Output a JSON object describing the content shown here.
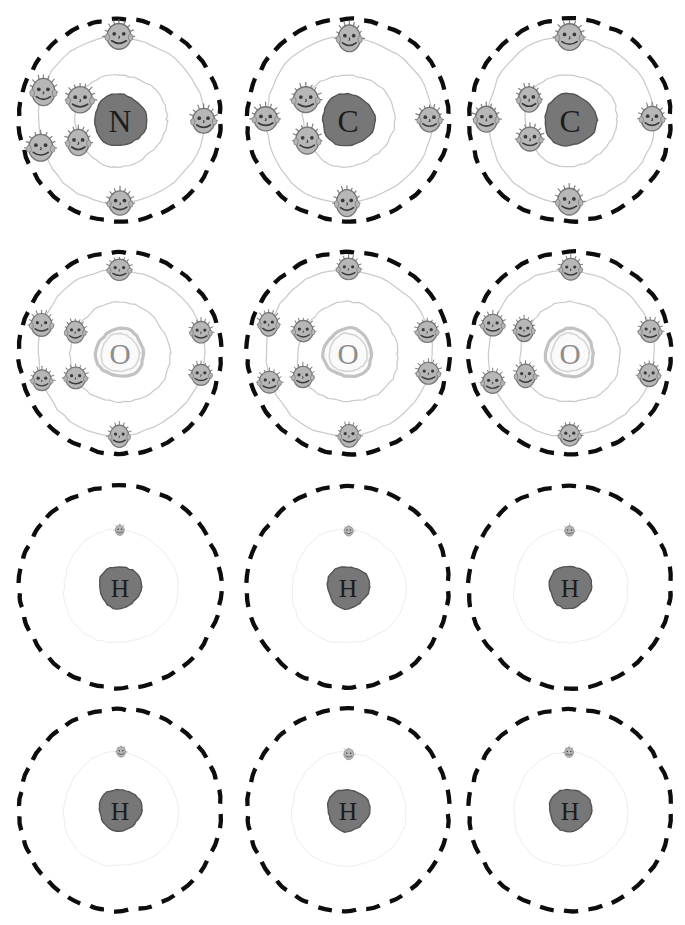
{
  "page": {
    "width": 685,
    "height": 925,
    "background": "#ffffff"
  },
  "style": {
    "shell_dash_color": "#0d0d0d",
    "orbit_line_color": "#bdbdbd",
    "orbit_line_faint": "#d8d8d8",
    "electron_fill": "#b4b4b4",
    "electron_stroke": "#6e6e6e",
    "electron_face_color": "#3a3a3a",
    "nucleus_dark_fill": "#6f6f6f",
    "nucleus_dark_stroke": "#4a4a4a",
    "nucleus_light_fill": "#fafafa",
    "nucleus_light_stroke": "#c2c2c2",
    "label_color": "#1c1c1c",
    "label_color_light": "#8d8d8d"
  },
  "legend": {
    "nucleus_note": "Nucleus labelled with element symbol",
    "electron_note": "Each electron is drawn as a smiling cartoon face",
    "outer_boundary_note": "Outer boundary drawn as a thick black dashed circle"
  },
  "grid": {
    "rows": 4,
    "columns": 3,
    "cell_width": 230,
    "cell_height": 230
  },
  "atoms": [
    {
      "id": "atom-r1c1",
      "symbol": "N",
      "name": "nitrogen",
      "row": 1,
      "column": 1,
      "x": 5,
      "y": 5,
      "nucleus_tone": "dark",
      "nucleus_radius": 26,
      "electron_size": "large",
      "shells": [
        {
          "index": 1,
          "radius": 46,
          "electron_count": 2,
          "angles": [
            242,
            298
          ]
        },
        {
          "index": 2,
          "radius": 83,
          "electron_count": 5,
          "angles": [
            250,
            290,
            180,
            0,
            90
          ]
        }
      ],
      "total_electrons": 7,
      "outer_dashed_radius": 101
    },
    {
      "id": "atom-r1c2",
      "symbol": "C",
      "name": "carbon",
      "row": 1,
      "column": 2,
      "x": 233,
      "y": 5,
      "nucleus_tone": "dark",
      "nucleus_radius": 26,
      "electron_size": "large",
      "shells": [
        {
          "index": 1,
          "radius": 46,
          "electron_count": 2,
          "angles": [
            244,
            296
          ]
        },
        {
          "index": 2,
          "radius": 83,
          "electron_count": 4,
          "angles": [
            270,
            180,
            0,
            90
          ]
        }
      ],
      "total_electrons": 6,
      "outer_dashed_radius": 101
    },
    {
      "id": "atom-r1c3",
      "symbol": "C",
      "name": "carbon",
      "row": 1,
      "column": 3,
      "x": 455,
      "y": 5,
      "nucleus_tone": "dark",
      "nucleus_radius": 26,
      "electron_size": "large",
      "shells": [
        {
          "index": 1,
          "radius": 46,
          "electron_count": 2,
          "angles": [
            244,
            296
          ]
        },
        {
          "index": 2,
          "radius": 83,
          "electron_count": 4,
          "angles": [
            270,
            180,
            0,
            90
          ]
        }
      ],
      "total_electrons": 6,
      "outer_dashed_radius": 101
    },
    {
      "id": "atom-r2c1",
      "symbol": "O",
      "name": "oxygen",
      "row": 2,
      "column": 1,
      "x": 5,
      "y": 238,
      "nucleus_tone": "light",
      "nucleus_radius": 24,
      "electron_size": "medium",
      "shells": [
        {
          "index": 1,
          "radius": 50,
          "electron_count": 2,
          "angles": [
            242,
            296
          ]
        },
        {
          "index": 2,
          "radius": 83,
          "electron_count": 6,
          "angles": [
            250,
            290,
            180,
            0,
            105,
            75
          ]
        }
      ],
      "total_electrons": 8,
      "outer_dashed_radius": 101
    },
    {
      "id": "atom-r2c2",
      "symbol": "O",
      "name": "oxygen",
      "row": 2,
      "column": 2,
      "x": 233,
      "y": 238,
      "nucleus_tone": "light",
      "nucleus_radius": 24,
      "electron_size": "medium",
      "shells": [
        {
          "index": 1,
          "radius": 50,
          "electron_count": 2,
          "angles": [
            242,
            296
          ]
        },
        {
          "index": 2,
          "radius": 83,
          "electron_count": 6,
          "angles": [
            250,
            290,
            180,
            0,
            105,
            75
          ]
        }
      ],
      "total_electrons": 8,
      "outer_dashed_radius": 101
    },
    {
      "id": "atom-r2c3",
      "symbol": "O",
      "name": "oxygen",
      "row": 2,
      "column": 3,
      "x": 455,
      "y": 238,
      "nucleus_tone": "light",
      "nucleus_radius": 24,
      "electron_size": "medium",
      "shells": [
        {
          "index": 1,
          "radius": 50,
          "electron_count": 2,
          "angles": [
            242,
            296
          ]
        },
        {
          "index": 2,
          "radius": 83,
          "electron_count": 6,
          "angles": [
            250,
            290,
            180,
            0,
            105,
            75
          ]
        }
      ],
      "total_electrons": 8,
      "outer_dashed_radius": 101
    },
    {
      "id": "atom-r3c1",
      "symbol": "H",
      "name": "hydrogen",
      "row": 3,
      "column": 1,
      "x": 5,
      "y": 472,
      "nucleus_tone": "dark",
      "nucleus_radius": 21,
      "electron_size": "small",
      "shells": [
        {
          "index": 1,
          "radius": 57,
          "electron_count": 1,
          "angles": [
            0
          ]
        }
      ],
      "total_electrons": 1,
      "outer_dashed_radius": 101
    },
    {
      "id": "atom-r3c2",
      "symbol": "H",
      "name": "hydrogen",
      "row": 3,
      "column": 2,
      "x": 233,
      "y": 472,
      "nucleus_tone": "dark",
      "nucleus_radius": 21,
      "electron_size": "small",
      "shells": [
        {
          "index": 1,
          "radius": 57,
          "electron_count": 1,
          "angles": [
            0
          ]
        }
      ],
      "total_electrons": 1,
      "outer_dashed_radius": 101
    },
    {
      "id": "atom-r3c3",
      "symbol": "H",
      "name": "hydrogen",
      "row": 3,
      "column": 3,
      "x": 455,
      "y": 472,
      "nucleus_tone": "dark",
      "nucleus_radius": 21,
      "electron_size": "small",
      "shells": [
        {
          "index": 1,
          "radius": 57,
          "electron_count": 1,
          "angles": [
            0
          ]
        }
      ],
      "total_electrons": 1,
      "outer_dashed_radius": 101
    },
    {
      "id": "atom-r4c1",
      "symbol": "H",
      "name": "hydrogen",
      "row": 4,
      "column": 1,
      "x": 5,
      "y": 695,
      "nucleus_tone": "dark",
      "nucleus_radius": 21,
      "electron_size": "small",
      "shells": [
        {
          "index": 1,
          "radius": 57,
          "electron_count": 1,
          "angles": [
            0
          ]
        }
      ],
      "total_electrons": 1,
      "outer_dashed_radius": 101
    },
    {
      "id": "atom-r4c2",
      "symbol": "H",
      "name": "hydrogen",
      "row": 4,
      "column": 2,
      "x": 233,
      "y": 695,
      "nucleus_tone": "dark",
      "nucleus_radius": 21,
      "electron_size": "small",
      "shells": [
        {
          "index": 1,
          "radius": 57,
          "electron_count": 1,
          "angles": [
            0
          ]
        }
      ],
      "total_electrons": 1,
      "outer_dashed_radius": 101
    },
    {
      "id": "atom-r4c3",
      "symbol": "H",
      "name": "hydrogen",
      "row": 4,
      "column": 3,
      "x": 455,
      "y": 695,
      "nucleus_tone": "dark",
      "nucleus_radius": 21,
      "electron_size": "small",
      "shells": [
        {
          "index": 1,
          "radius": 57,
          "electron_count": 1,
          "angles": [
            0
          ]
        }
      ],
      "total_electrons": 1,
      "outer_dashed_radius": 101
    }
  ]
}
